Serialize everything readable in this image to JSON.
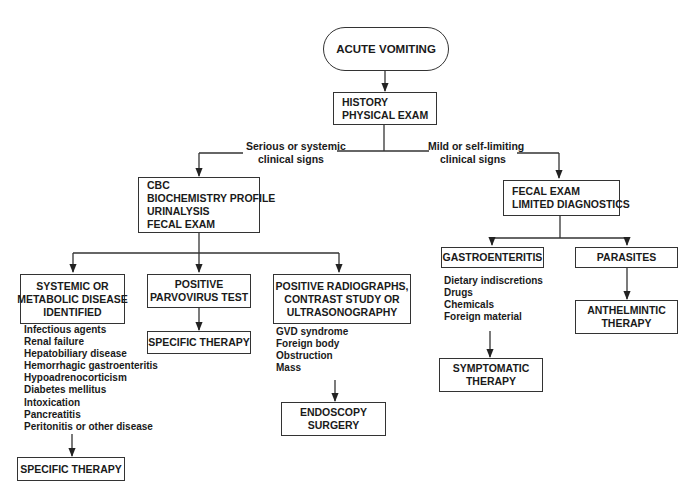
{
  "diagram": {
    "title": "ACUTE VOMITING",
    "nodes": {
      "start": {
        "lines": [
          "ACUTE VOMITING"
        ]
      },
      "history": {
        "lines": [
          "HISTORY",
          "PHYSICAL EXAM"
        ]
      },
      "labs": {
        "lines": [
          "CBC",
          "BIOCHEMISTRY PROFILE",
          "URINALYSIS",
          "FECAL EXAM"
        ]
      },
      "fecal": {
        "lines": [
          "FECAL EXAM",
          "LIMITED DIAGNOSTICS"
        ]
      },
      "systemic": {
        "lines": [
          "SYSTEMIC OR",
          "METABOLIC DISEASE",
          "IDENTIFIED"
        ]
      },
      "parvo": {
        "lines": [
          "POSITIVE",
          "PARVOVIRUS TEST"
        ]
      },
      "radiographs": {
        "lines": [
          "POSITIVE RADIOGRAPHS,",
          "CONTRAST STUDY OR",
          "ULTRASONOGRAPHY"
        ]
      },
      "gastro": {
        "lines": [
          "GASTROENTERITIS"
        ]
      },
      "parasites": {
        "lines": [
          "PARASITES"
        ]
      },
      "parvo_therapy": {
        "lines": [
          "SPECIFIC THERAPY"
        ]
      },
      "systemic_therapy": {
        "lines": [
          "SPECIFIC THERAPY"
        ]
      },
      "endoscopy": {
        "lines": [
          "ENDOSCOPY",
          "SURGERY"
        ]
      },
      "symptomatic": {
        "lines": [
          "SYMPTOMATIC",
          "THERAPY"
        ]
      },
      "anthelmintic": {
        "lines": [
          "ANTHELMINTIC",
          "THERAPY"
        ]
      }
    },
    "edge_labels": {
      "serious": [
        "Serious or systemic",
        "clinical signs"
      ],
      "mild": [
        "Mild or self-limiting",
        "clinical signs"
      ]
    },
    "lists": {
      "systemic_causes": [
        "Infectious agents",
        "Renal failure",
        "Hepatobiliary disease",
        "Hemorrhagic gastroenteritis",
        "Hypoadrenocorticism",
        "Diabetes mellitus",
        "Intoxication",
        "Pancreatitis",
        "Peritonitis or other disease"
      ],
      "radiograph_findings": [
        "GVD syndrome",
        "Foreign body",
        "Obstruction",
        "Mass"
      ],
      "gastro_causes": [
        "Dietary indiscretions",
        "Drugs",
        "Chemicals",
        "Foreign material"
      ]
    },
    "colors": {
      "line": "#333333",
      "text": "#1a1a1a",
      "background": "#ffffff"
    }
  }
}
